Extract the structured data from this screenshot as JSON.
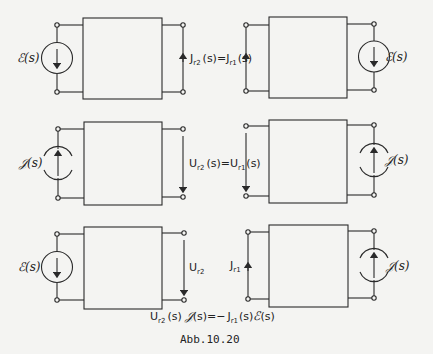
{
  "figure": {
    "caption": "Abb.10.20",
    "stroke_color": "#2a2a2a",
    "background": "#f4f4f2"
  },
  "rows": [
    {
      "left": {
        "source_type": "voltage",
        "source_label": "ℰ(s)",
        "port_side_element": "current_arrow_up"
      },
      "equation": {
        "lhs": "J",
        "lhs_sub": "r2",
        "mid": "(s) = ",
        "rhs": "J",
        "rhs_sub": "r1",
        "tail": "(s)"
      },
      "right": {
        "source_type": "voltage",
        "source_label": "ℰ(s)",
        "port_side_element": "current_arrow_up"
      }
    },
    {
      "left": {
        "source_type": "current",
        "source_label": "𝒥(s)",
        "port_side_element": "voltage_arrow_down"
      },
      "equation": {
        "lhs": "U",
        "lhs_sub": "r2",
        "mid": "(s) = ",
        "rhs": "U",
        "rhs_sub": "r1",
        "tail": "(s)"
      },
      "right": {
        "source_type": "current",
        "source_label": "𝒥(s)",
        "port_side_element": "voltage_arrow_down"
      }
    },
    {
      "left": {
        "source_type": "voltage",
        "source_label": "ℰ(s)",
        "port_side_element": "voltage_arrow_down",
        "port_label": "U",
        "port_sub": "r2"
      },
      "right": {
        "source_type": "current",
        "source_label": "𝒥(s)",
        "port_side_element": "current_arrow_up",
        "port_label": "J",
        "port_sub": "r1"
      },
      "equation": {
        "part1": "U",
        "part1_sub": "r2",
        "part2": "(s) ",
        "part3": "𝒥(s) = − ",
        "part4": "J",
        "part4_sub": "r1",
        "part5": "(s) ",
        "part6": "ℰ(s)"
      }
    }
  ],
  "labels": {
    "r1_label": "ℰ(s)",
    "r1_right_label": "ℰ(s)",
    "r2_left_label": "𝒥(s)",
    "r2_right_label": "𝒥(s)",
    "r3_left_label": "ℰ(s)",
    "r3_right_label": "𝒥(s)",
    "paren_s": "(s)",
    "paren_s_eq": "(s)=",
    "J": "J",
    "U": "U",
    "sub_r1": "r1",
    "sub_r2": "r2",
    "script_J": "𝒥",
    "script_E": "ℰ",
    "eq3_mid": "(s)=−"
  }
}
